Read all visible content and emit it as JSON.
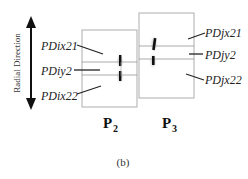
{
  "axis": {
    "label": "Radial Direction"
  },
  "panels": [
    {
      "name": "P",
      "subscript": "2",
      "labels": [
        "PDix21",
        "PDiy2",
        "PDix22"
      ]
    },
    {
      "name": "P",
      "subscript": "3",
      "labels": [
        "PDjx21",
        "PDjy2",
        "PDjx22"
      ]
    }
  ],
  "caption": "(b)",
  "colors": {
    "box": "#9a9a9a",
    "line": "#222222",
    "spot": "#111111"
  }
}
